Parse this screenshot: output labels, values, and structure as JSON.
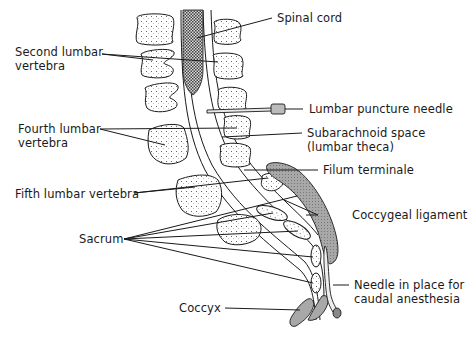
{
  "diagram": {
    "labels": {
      "spinal_cord": "Spinal cord",
      "second_lumbar_1": "Second lumbar",
      "second_lumbar_2": "vertebra",
      "lumbar_puncture_needle": "Lumbar puncture needle",
      "fourth_lumbar_1": "Fourth lumbar",
      "fourth_lumbar_2": "vertebra",
      "subarachnoid_1": "Subarachnoid space",
      "subarachnoid_2": "(lumbar theca)",
      "fifth_lumbar": "Fifth lumbar vertebra",
      "filum_terminale": "Filum terminale",
      "coccygeal_ligament": "Coccygeal ligament",
      "sacrum": "Sacrum",
      "needle_caudal_1": "Needle in place for",
      "needle_caudal_2": "caudal anesthesia",
      "coccyx": "Coccyx"
    },
    "colors": {
      "ink": "#1a1a1a",
      "shade": "#9a9a9a",
      "cord_fill": "#6e6e6e",
      "background": "#ffffff"
    }
  }
}
